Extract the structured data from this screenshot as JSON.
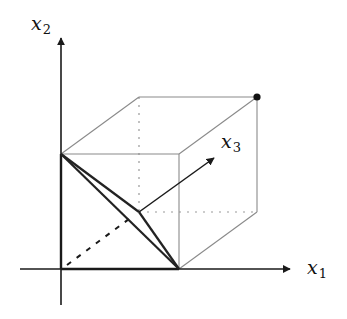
{
  "diagram": {
    "axes": {
      "x1": {
        "label": "x",
        "sub": "1"
      },
      "x2": {
        "label": "x",
        "sub": "2"
      },
      "x3": {
        "label": "x",
        "sub": "3"
      }
    },
    "cube": {
      "front_face": {
        "x": 61,
        "y": 154,
        "size": 115
      },
      "back_offset": {
        "dx": 78,
        "dy": -57
      }
    },
    "marked_vertex": "far top-right corner (1,1,1)",
    "highlighted_triangle": "simplex vertices e1, e2, e3"
  },
  "colors": {
    "axis": "#1a1a1a",
    "cube_edge": "#8a8a8a",
    "triangle": "#222222",
    "dot": "#111111"
  }
}
